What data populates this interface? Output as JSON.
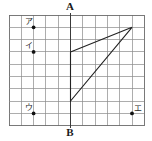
{
  "figure": {
    "title_top": "A",
    "title_bottom": "B",
    "canvas": {
      "width": 152,
      "height": 141
    },
    "colors": {
      "grid": "#8a8a8a",
      "border": "#6a6a6a",
      "axis": "#3a3a3a",
      "shape": "#222222",
      "point": "#111111",
      "background": "#ffffff"
    },
    "grid": {
      "x0": 9,
      "y0": 15,
      "cell": 12.3,
      "cols": 11,
      "rows": 9
    },
    "axis": {
      "name": "AB",
      "top_label": "A",
      "bottom_label": "B",
      "col_index": 5,
      "top_label_pos": {
        "x": 70,
        "y": 7
      },
      "bottom_label_pos": {
        "x": 70,
        "y": 133
      }
    },
    "shape": {
      "name": "triangle-arrow",
      "closed": true,
      "vertices_grid": [
        {
          "col": 5,
          "row": 3
        },
        {
          "col": 10,
          "row": 1
        },
        {
          "col": 5,
          "row": 7
        }
      ]
    },
    "points": [
      {
        "id": "a",
        "label": "ア",
        "col": 2,
        "row": 1,
        "label_dx": -5,
        "label_dy": -6
      },
      {
        "id": "i",
        "label": "イ",
        "col": 2,
        "row": 3,
        "label_dx": -5,
        "label_dy": -6
      },
      {
        "id": "u",
        "label": "ウ",
        "col": 2,
        "row": 8,
        "label_dx": -5,
        "label_dy": -6
      },
      {
        "id": "e",
        "label": "エ",
        "col": 10,
        "row": 8,
        "label_dx": 6,
        "label_dy": -5
      }
    ]
  }
}
